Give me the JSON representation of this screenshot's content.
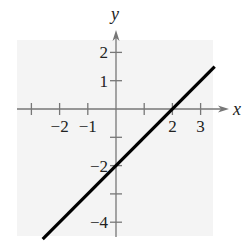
{
  "chart_data": {
    "type": "line",
    "title": "",
    "xlabel": "x",
    "ylabel": "y",
    "xlim": [
      -3,
      3.5
    ],
    "ylim": [
      -4.5,
      2.5
    ],
    "x_ticks": [
      -3,
      -2,
      -1,
      0,
      1,
      2,
      3
    ],
    "x_tick_labels": [
      {
        "value": -2,
        "label": "−2"
      },
      {
        "value": -1,
        "label": "−1"
      },
      {
        "value": 2,
        "label": "2"
      },
      {
        "value": 3,
        "label": "3"
      }
    ],
    "y_ticks": [
      2,
      1,
      -1,
      -2,
      -3,
      -4
    ],
    "y_tick_labels": [
      {
        "value": 2,
        "label": "2"
      },
      {
        "value": 1,
        "label": "1"
      },
      {
        "value": -2,
        "label": "−2"
      },
      {
        "value": -4,
        "label": "−4"
      }
    ],
    "grid": false,
    "background_panel": true,
    "series": [
      {
        "name": "y = x - 2",
        "equation": "y = x - 2",
        "x": [
          -2.6,
          3.5
        ],
        "y": [
          -4.6,
          1.5
        ],
        "color": "#000000"
      }
    ]
  },
  "labels": {
    "x_axis": "x",
    "y_axis": "y"
  },
  "colors": {
    "line": "#000000",
    "axis": "#777777",
    "panel": "#f3f3f3"
  }
}
